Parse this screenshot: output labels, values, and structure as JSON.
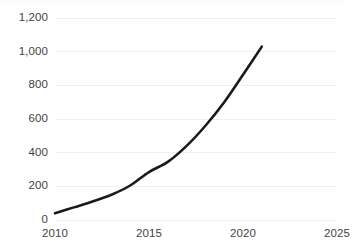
{
  "chart_data": {
    "type": "line",
    "title": "",
    "subtitle": "",
    "xlabel": "",
    "ylabel": "",
    "xlim": [
      2010,
      2025
    ],
    "ylim": [
      0,
      1200
    ],
    "grid": true,
    "grid_axis": "y",
    "legend": false,
    "legend_position": "none",
    "x": [
      2010,
      2011,
      2012,
      2013,
      2014,
      2015,
      2016,
      2017,
      2018,
      2019,
      2020,
      2021
    ],
    "series": [
      {
        "name": "",
        "color": "#1a1a1a",
        "values": [
          40,
          75,
          110,
          150,
          205,
          285,
          345,
          440,
          560,
          700,
          863,
          1030
        ]
      }
    ],
    "y_tick_labels": [
      "0",
      "200",
      "400",
      "600",
      "800",
      "1,000",
      "1,200"
    ],
    "y_tick_values": [
      0,
      200,
      400,
      600,
      800,
      1000,
      1200
    ],
    "x_tick_labels": [
      "2010",
      "2015",
      "2020",
      "2025"
    ],
    "x_tick_values": [
      2010,
      2015,
      2020,
      2025
    ],
    "colors": {
      "line": "#1a1a1a",
      "gridline": "#eff0f2",
      "axis_text": "#3f3f3f",
      "background": "#ffffff"
    }
  }
}
